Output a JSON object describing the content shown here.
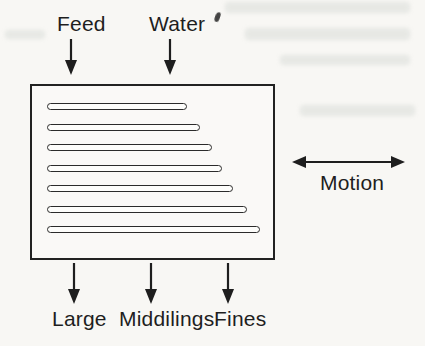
{
  "figure": {
    "type": "shaking-table-diagram",
    "inputs": [
      {
        "label": "Feed"
      },
      {
        "label": "Water"
      }
    ],
    "motion": {
      "label": "Motion"
    },
    "outputs": [
      {
        "label": "Large"
      },
      {
        "label": "Middilings"
      },
      {
        "label": "Fines"
      }
    ],
    "riffles": {
      "count": 7,
      "lengths_px": [
        140,
        153,
        165,
        175,
        186,
        200,
        213
      ]
    },
    "colors": {
      "ink": "#1e1e1e",
      "paper": "#f8f7f4",
      "riffle_fill": "#fdfdfb"
    }
  }
}
